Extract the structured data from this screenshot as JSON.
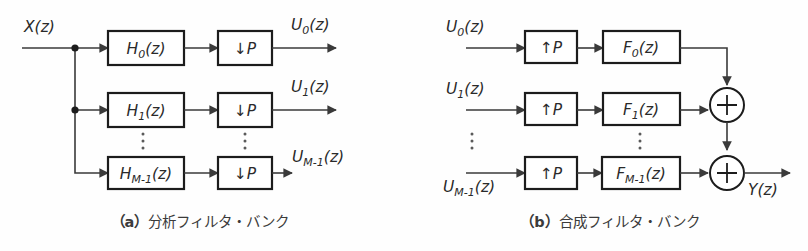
{
  "figure": {
    "background_color": "#fefefe",
    "line_color": "#3a3a3a",
    "box_border_color": "#1c1c1c",
    "text_color": "#2a2a2a"
  },
  "panel_a": {
    "caption_prefix": "（a）",
    "caption_text": "分析フィルタ・バンク",
    "caption_full": "（a）分析フィルタ・バンク",
    "input_label": "X(z)",
    "rows": [
      {
        "filter_base": "H",
        "filter_sub": "0",
        "filter_tail": "(z)",
        "filter_label": "H0(z)",
        "rate_arrow": "↓",
        "rate_factor": "P",
        "rate_label": "↓P",
        "output_base": "U",
        "output_sub": "0",
        "output_tail": "(z)",
        "output_label": "U0(z)"
      },
      {
        "filter_base": "H",
        "filter_sub": "1",
        "filter_tail": "(z)",
        "filter_label": "H1(z)",
        "rate_arrow": "↓",
        "rate_factor": "P",
        "rate_label": "↓P",
        "output_base": "U",
        "output_sub": "1",
        "output_tail": "(z)",
        "output_label": "U1(z)"
      },
      {
        "filter_base": "H",
        "filter_sub": "M-1",
        "filter_tail": "(z)",
        "filter_label": "HM-1(z)",
        "rate_arrow": "↓",
        "rate_factor": "P",
        "rate_label": "↓P",
        "output_base": "U",
        "output_sub": "M-1",
        "output_tail": "(z)",
        "output_label": "UM-1(z)"
      }
    ],
    "ellipsis_symbol": "⋮"
  },
  "panel_b": {
    "caption_prefix": "（b）",
    "caption_text": "合成フィルタ・バンク",
    "caption_full": "（b）合成フィルタ・バンク",
    "output_label": "Y(z)",
    "adder_symbol": "+",
    "rows": [
      {
        "input_base": "U",
        "input_sub": "0",
        "input_tail": "(z)",
        "input_label": "U0(z)",
        "rate_arrow": "↑",
        "rate_factor": "P",
        "rate_label": "↑P",
        "filter_base": "F",
        "filter_sub": "0",
        "filter_tail": "(z)",
        "filter_label": "F0(z)"
      },
      {
        "input_base": "U",
        "input_sub": "1",
        "input_tail": "(z)",
        "input_label": "U1(z)",
        "rate_arrow": "↑",
        "rate_factor": "P",
        "rate_label": "↑P",
        "filter_base": "F",
        "filter_sub": "1",
        "filter_tail": "(z)",
        "filter_label": "F1(z)"
      },
      {
        "input_base": "U",
        "input_sub": "M-1",
        "input_tail": "(z)",
        "input_label": "UM-1(z)",
        "rate_arrow": "↑",
        "rate_factor": "P",
        "rate_label": "↑P",
        "filter_base": "F",
        "filter_sub": "M-1",
        "filter_tail": "(z)",
        "filter_label": "FM-1(z)"
      }
    ],
    "ellipsis_symbol": "⋮"
  }
}
